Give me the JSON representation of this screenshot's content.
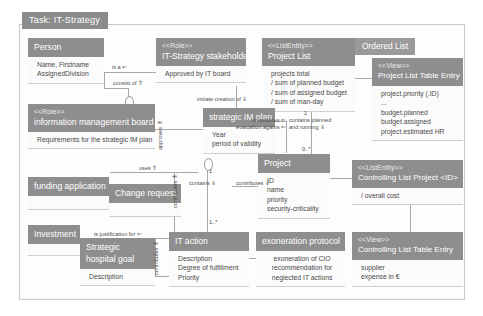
{
  "task_tab": {
    "label": "Task: IT-Strategy"
  },
  "boxes": {
    "person": {
      "stereotype": "",
      "name": "Person",
      "attributes": [
        "Name, Firstname",
        "AssignedDivision"
      ]
    },
    "stakeholder": {
      "stereotype": "<<Role>>",
      "name": "IT-Strategy stakeholder",
      "attributes": [
        "Approved by IT board"
      ]
    },
    "project_list": {
      "stereotype": "<<ListEntity>>",
      "name": "Project List",
      "attributes": [
        "projects total",
        "/ sum of planned budget",
        "/ sum of assigned budget",
        "/ sum of man-day"
      ]
    },
    "ordered_list_tag": {
      "label": "Ordered List"
    },
    "project_list_table_entry": {
      "stereotype": "<<View>>",
      "name": "Project List Table Entry",
      "attributes": [
        "project.priority (.ID)",
        "...",
        "budget.planned",
        "budget.assigned",
        "project.estimated HR"
      ]
    },
    "im_board": {
      "stereotype": "<<Role>>",
      "name": "information management board",
      "attributes": [
        "Requirements for the strategic IM plan"
      ]
    },
    "strategic_im_plan": {
      "stereotype": "",
      "name": "strategic IM plan",
      "attributes": [
        "Year",
        "period of validity"
      ]
    },
    "project": {
      "stereotype": "",
      "name": "Project",
      "attributes": [
        "ID",
        "name",
        "priority",
        "security-criticality"
      ]
    },
    "controlling_list_project": {
      "stereotype": "<<ListEntity>>",
      "name": "Controlling List Project <ID>",
      "attributes": [
        "/ overall cost"
      ]
    },
    "funding_application": {
      "stereotype": "",
      "name": "funding application",
      "attributes": []
    },
    "change_request": {
      "stereotype": "",
      "name": "Change request",
      "attributes": []
    },
    "investment": {
      "stereotype": "",
      "name": "Investment",
      "attributes": []
    },
    "strategic_hospital_goal": {
      "stereotype": "",
      "name": "Strategic hospital goal",
      "attributes": [
        "Description"
      ]
    },
    "it_action": {
      "stereotype": "",
      "name": "IT action",
      "attributes": [
        "Description",
        "Degree of fulfillment",
        "Priority"
      ]
    },
    "exoneration_protocol": {
      "stereotype": "",
      "name": "exoneration protocol",
      "attributes": [
        "exoneration of CIO",
        "recommendation for",
        "neglected IT actions"
      ]
    },
    "controlling_list_table_entry": {
      "stereotype": "<<View>>",
      "name": "Controlling  List Table Entry",
      "attributes": [
        "supplier",
        "expense in €"
      ]
    }
  },
  "edges": {
    "is_a": "is a ⇐",
    "consist_of": "consist of ⇑",
    "approves": "approves ⇑",
    "initiate_creation_of": "initiate creation of ⇓",
    "contributes_eval": "contributes ⇐\nevaluation agains ⇐",
    "contains_planned_running": "contains planned\nand running ⇓",
    "uses": "uses ⇑",
    "justification_for": "is justification for ⇐",
    "contributes_down": "contributes ⇓",
    "contributes_left": "contributes ⇐",
    "contains_down": "contains ⇓",
    "contributes_vert": "contributes ⇑",
    "contributes_vert2": "contributes ⇑"
  },
  "multiplicities": {
    "m_one_top": "1",
    "m_one_star": "1..*",
    "m_one_right": "1",
    "m_zero_star": "0..*"
  },
  "colors": {
    "header_gray": "#8e8e8e",
    "tab_gray": "#8c8c8c",
    "body_bg": "#fbfbfb",
    "line_gray": "#a8a8a8",
    "frame_border": "#c9c9c9"
  }
}
